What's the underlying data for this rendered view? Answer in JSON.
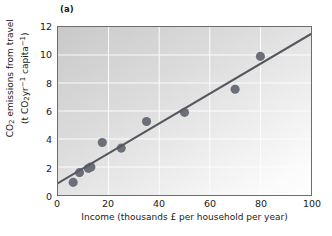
{
  "figure": {
    "panel_label": "(a)",
    "accent_point_color": "#6b6f78",
    "trend_line_color": "#55585f",
    "frame_color": "#6d6d6d",
    "background_light": "#ffffff",
    "background_dark": "#c9c9c9"
  },
  "chart_data": {
    "type": "scatter",
    "title": "(a)",
    "xlabel_parts": {
      "text": "Income (thousands £ per household per year)"
    },
    "ylabel_parts": {
      "line1": "CO",
      "line1_sub": "2",
      "line1_rest": " emissions from travel",
      "line2_open": "(t CO",
      "line2_sub": "2",
      "line2_mid": "yr",
      "line2_sup1": "−1",
      "line2_mid2": " capita",
      "line2_sup2": "−1",
      "line2_close": ")"
    },
    "xlim": [
      0,
      100
    ],
    "ylim": [
      0,
      12
    ],
    "xticks": [
      0,
      20,
      40,
      60,
      80,
      100
    ],
    "yticks": [
      0,
      2,
      4,
      6,
      8,
      10,
      12
    ],
    "xtick_labels": [
      "0",
      "20",
      "40",
      "60",
      "80",
      "100"
    ],
    "ytick_labels": [
      "0",
      "2",
      "4",
      "6",
      "8",
      "10",
      "12"
    ],
    "grid": true,
    "legend": null,
    "series": [
      {
        "name": "Households",
        "marker": "circle",
        "color": "#6b6f78",
        "points": [
          {
            "x": 6.0,
            "y": 0.9
          },
          {
            "x": 8.5,
            "y": 1.6
          },
          {
            "x": 12.0,
            "y": 1.9
          },
          {
            "x": 13.0,
            "y": 2.0
          },
          {
            "x": 17.5,
            "y": 3.75
          },
          {
            "x": 25.0,
            "y": 3.35
          },
          {
            "x": 35.0,
            "y": 5.25
          },
          {
            "x": 50.0,
            "y": 5.9
          },
          {
            "x": 70.0,
            "y": 7.55
          },
          {
            "x": 80.0,
            "y": 9.9
          }
        ]
      },
      {
        "name": "Linear trend",
        "marker": "line",
        "color": "#55585f",
        "line": {
          "x0": 0,
          "y0": 0.85,
          "x1": 100,
          "y1": 11.5
        }
      }
    ]
  }
}
